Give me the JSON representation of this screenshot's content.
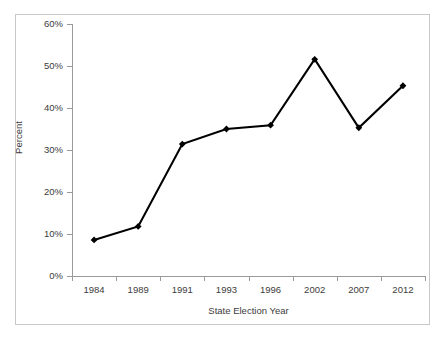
{
  "chart_data": {
    "type": "line",
    "title": "",
    "subtitle": "",
    "xlabel": "State Election Year",
    "ylabel": "Percent",
    "categories": [
      "1984",
      "1989",
      "1991",
      "1993",
      "1996",
      "2002",
      "2007",
      "2012"
    ],
    "values": [
      8.6,
      11.8,
      31.4,
      35.0,
      35.9,
      51.6,
      35.3,
      45.3
    ],
    "series": [
      {
        "name": "Percent",
        "values": [
          8.6,
          11.8,
          31.4,
          35.0,
          35.9,
          51.6,
          35.3,
          45.3
        ]
      }
    ],
    "ylim": [
      0,
      60
    ],
    "ytick_values": [
      0,
      10,
      20,
      30,
      40,
      50,
      60
    ],
    "ytick_labels": [
      "0%",
      "10%",
      "20%",
      "30%",
      "40%",
      "50%",
      "60%"
    ],
    "xtick_labels": [
      "1984",
      "1989",
      "1991",
      "1993",
      "1996",
      "2002",
      "2007",
      "2012"
    ],
    "grid": false,
    "legend": false,
    "legend_position": "none",
    "marker": "diamond",
    "line_color": "#000000",
    "marker_color": "#000000",
    "axis_color": "#9a9a9a",
    "text_color": "#3c3c3c",
    "background_color": "#ffffff",
    "frame_color": "#c9c9c9",
    "annotations": []
  },
  "axis": {
    "y_title": "Percent",
    "x_title": "State Election Year"
  }
}
